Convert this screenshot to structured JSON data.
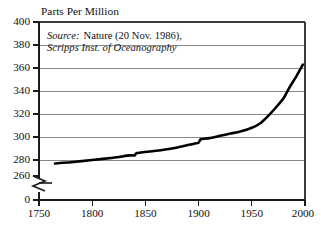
{
  "chart_data": {
    "type": "line",
    "title": "",
    "ylabel": "Parts Per Million",
    "xlabel": "",
    "xlim": [
      1750,
      2000
    ],
    "ylim": [
      260,
      400
    ],
    "grid": true,
    "legend": "none",
    "axis_break": {
      "present": true,
      "symbol": "zigzag",
      "between": [
        0,
        260
      ]
    },
    "annotations": [
      {
        "id": "source",
        "line1_lead": "Source:",
        "line1_rest": "Nature (20 Nov. 1986),",
        "line2": "Scripps Inst. of Oceanography"
      }
    ],
    "yticks": [
      400,
      380,
      360,
      340,
      320,
      300,
      280,
      260,
      0
    ],
    "ytick_labels": [
      "400",
      "380",
      "360",
      "340",
      "320",
      "300",
      "280",
      "260",
      "0"
    ],
    "xticks": [
      1750,
      1800,
      1850,
      1900,
      1950,
      2000
    ],
    "xtick_labels": [
      "1750",
      "1800",
      "1850",
      "1900",
      "1950",
      "2000"
    ],
    "series": [
      {
        "name": "Atmospheric CO2 concentration",
        "x": [
          1765,
          1780,
          1800,
          1820,
          1835,
          1840,
          1842,
          1860,
          1875,
          1885,
          1895,
          1900,
          1902,
          1910,
          1920,
          1930,
          1940,
          1950,
          1958,
          1965,
          1972,
          1980,
          1986,
          1992,
          1998
        ],
        "values": [
          277,
          278,
          280,
          282,
          284,
          284,
          286,
          288,
          290,
          292,
          294,
          295,
          298,
          299,
          301,
          303,
          305,
          308,
          312,
          318,
          325,
          334,
          344,
          353,
          363
        ]
      }
    ],
    "colors": {
      "curve": "#000000",
      "grid": "#8a8a8a",
      "axis": "#1a1a1a",
      "background": "#ffffff"
    }
  },
  "geometry": {
    "plot_left": 39,
    "plot_right": 305,
    "plot_top": 22,
    "plot_bottom": 183,
    "baseline_y": 200,
    "y_value_top": 400,
    "y_value_bottom": 260
  }
}
